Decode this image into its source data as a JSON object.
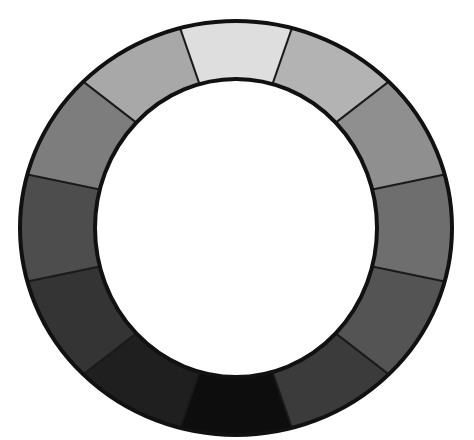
{
  "figure": {
    "background_color": "#ffffff",
    "outline_color": "#111111",
    "outline_width_px": 4,
    "segment_divider_color": "#1a1a1a",
    "segment_divider_width_px": 2,
    "geometry": {
      "center_x": 236,
      "center_y": 228,
      "outer_radius_x": 216,
      "outer_radius_y": 207,
      "inner_radius_x": 141,
      "inner_radius_y": 149,
      "segment_count": 12,
      "segment_span_degrees": 30,
      "start_angle_degrees": -105
    }
  },
  "chart_data": {
    "type": "pie",
    "subtitle": "",
    "xlabel": "",
    "ylabel": "",
    "legend_position": "none",
    "grid": false,
    "hole_fraction": 0.66,
    "categories": [
      "segment-01-top",
      "segment-02",
      "segment-03",
      "segment-04-right",
      "segment-05",
      "segment-06",
      "segment-07-bottom",
      "segment-08",
      "segment-09",
      "segment-10-left",
      "segment-11",
      "segment-12"
    ],
    "values": [
      1,
      1,
      1,
      1,
      1,
      1,
      1,
      1,
      1,
      1,
      1,
      1
    ],
    "colors": [
      "#dedede",
      "#b3b3b3",
      "#8f8f8f",
      "#6e6e6e",
      "#545454",
      "#3b3b3b",
      "#0d0d0d",
      "#1f1f1f",
      "#343434",
      "#4d4d4d",
      "#7d7d7d",
      "#a8a8a8"
    ],
    "segments": [
      {
        "index": 1,
        "label": "segment-01-top",
        "start_angle": -105,
        "end_angle": -75,
        "color": "#dedede",
        "gray_level": 222
      },
      {
        "index": 2,
        "label": "segment-02",
        "start_angle": -75,
        "end_angle": -45,
        "color": "#b3b3b3",
        "gray_level": 179
      },
      {
        "index": 3,
        "label": "segment-03",
        "start_angle": -45,
        "end_angle": -15,
        "color": "#8f8f8f",
        "gray_level": 143
      },
      {
        "index": 4,
        "label": "segment-04-right",
        "start_angle": -15,
        "end_angle": 15,
        "color": "#6e6e6e",
        "gray_level": 110
      },
      {
        "index": 5,
        "label": "segment-05",
        "start_angle": 15,
        "end_angle": 45,
        "color": "#545454",
        "gray_level": 84
      },
      {
        "index": 6,
        "label": "segment-06",
        "start_angle": 45,
        "end_angle": 75,
        "color": "#3b3b3b",
        "gray_level": 59
      },
      {
        "index": 7,
        "label": "segment-07-bottom",
        "start_angle": 75,
        "end_angle": 105,
        "color": "#0d0d0d",
        "gray_level": 13
      },
      {
        "index": 8,
        "label": "segment-08",
        "start_angle": 105,
        "end_angle": 135,
        "color": "#1f1f1f",
        "gray_level": 31
      },
      {
        "index": 9,
        "label": "segment-09",
        "start_angle": 135,
        "end_angle": 165,
        "color": "#343434",
        "gray_level": 52
      },
      {
        "index": 10,
        "label": "segment-10-left",
        "start_angle": 165,
        "end_angle": 195,
        "color": "#4d4d4d",
        "gray_level": 77
      },
      {
        "index": 11,
        "label": "segment-11",
        "start_angle": 195,
        "end_angle": 225,
        "color": "#7d7d7d",
        "gray_level": 125
      },
      {
        "index": 12,
        "label": "segment-12",
        "start_angle": 225,
        "end_angle": 255,
        "color": "#a8a8a8",
        "gray_level": 168
      }
    ]
  }
}
